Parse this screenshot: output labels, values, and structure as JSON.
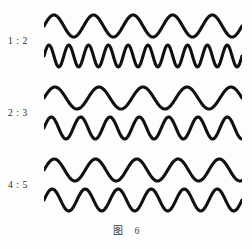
{
  "figure": {
    "caption_label": "图",
    "caption_number": "6",
    "ink_color": "#101010",
    "background_color": "#fdfdfd"
  },
  "chart_data": {
    "type": "line",
    "xlabel": "",
    "ylabel": "",
    "grid": false,
    "legend": "none",
    "x": [
      0,
      1
    ],
    "groups": [
      {
        "ratio_label": "1 : 2",
        "ratio_numerator": 1,
        "ratio_denominator": 2,
        "series": [
          {
            "name": "upper",
            "cycles": 5,
            "amplitude": 11,
            "phase": 0
          },
          {
            "name": "lower",
            "cycles": 10,
            "amplitude": 11,
            "phase": 0
          }
        ]
      },
      {
        "ratio_label": "2 : 3",
        "ratio_numerator": 2,
        "ratio_denominator": 3,
        "series": [
          {
            "name": "upper",
            "cycles": 4.5,
            "amplitude": 11,
            "phase": 0
          },
          {
            "name": "lower",
            "cycles": 6.75,
            "amplitude": 11,
            "phase": 0
          }
        ]
      },
      {
        "ratio_label": "4 : 5",
        "ratio_numerator": 4,
        "ratio_denominator": 5,
        "series": [
          {
            "name": "upper",
            "cycles": 4.8,
            "amplitude": 11,
            "phase": 0
          },
          {
            "name": "lower",
            "cycles": 6,
            "amplitude": 11,
            "phase": 0
          }
        ]
      }
    ],
    "layout": {
      "wave_left": 44,
      "wave_width": 198,
      "group_tops": [
        12,
        84,
        156
      ],
      "wave_spacing": 30,
      "wave_height": 28
    }
  }
}
